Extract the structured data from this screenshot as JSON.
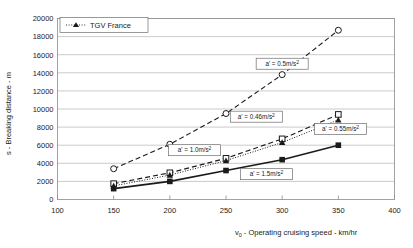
{
  "chart_data": {
    "type": "line",
    "title": "",
    "xlabel": "v0 - Operating cruising speed - km/hr",
    "ylabel": "s - Breaking distance - m",
    "xlim": [
      100,
      400
    ],
    "ylim": [
      0,
      20000
    ],
    "xticks": [
      100,
      150,
      200,
      250,
      300,
      350,
      400
    ],
    "yticks": [
      0,
      2000,
      4000,
      6000,
      8000,
      10000,
      12000,
      14000,
      16000,
      18000,
      20000
    ],
    "grid": true,
    "legend_position": "top-left",
    "series": [
      {
        "name": "a' = 0.5m/s2",
        "marker": "open-circle",
        "line": "dashed",
        "x": [
          150,
          200,
          250,
          300,
          350
        ],
        "values": [
          3400,
          6100,
          9500,
          13800,
          18700
        ]
      },
      {
        "name": "a' = 0.46m/s2 / a' = 0.55m/s2",
        "marker": "open-square",
        "line": "dashed",
        "x": [
          150,
          200,
          250,
          300,
          350
        ],
        "values": [
          1750,
          2950,
          4550,
          6700,
          9400
        ]
      },
      {
        "name": "TGV France",
        "marker": "filled-triangle",
        "line": "dotted",
        "x": [
          150,
          200,
          250,
          300,
          350
        ],
        "values": [
          1500,
          2700,
          4300,
          6300,
          8800
        ]
      },
      {
        "name": "a' = 1.5m/s2",
        "marker": "filled-square",
        "line": "solid",
        "x": [
          150,
          200,
          250,
          300,
          350
        ],
        "values": [
          1200,
          2000,
          3200,
          4400,
          6000
        ]
      }
    ],
    "annotations": [
      {
        "id": "ann-05",
        "text": "a' = 0.5m/s2",
        "base": "a' = 0.5m/s",
        "exp": "2",
        "x": 300,
        "y": 15000
      },
      {
        "id": "ann-046",
        "text": "a' = 0.46m/s2",
        "base": "a' = 0.46m/s",
        "exp": "2",
        "x": 277,
        "y": 9150
      },
      {
        "id": "ann-055",
        "text": "a' = 0.55m/s2",
        "base": "a' = 0.55m/s",
        "exp": "2",
        "x": 352,
        "y": 7800
      },
      {
        "id": "ann-10",
        "text": "a' = 1.0m/s2",
        "base": "a' = 1.0m/s",
        "exp": "2",
        "x": 222,
        "y": 5450
      },
      {
        "id": "ann-15",
        "text": "a' = 1.5m/s2",
        "base": "a' = 1.5m/s",
        "exp": "2",
        "x": 286,
        "y": 2800
      }
    ]
  },
  "legend": {
    "items": [
      {
        "label": "TGV France",
        "marker": "filled-triangle",
        "line": "dotted"
      }
    ]
  },
  "axes": {
    "x_title_base": "v",
    "x_title_sub": "0",
    "x_title_rest": " - Operating cruising speed - km/hr",
    "y_title": "s - Breaking distance - m",
    "x_tick_labels": [
      "100",
      "150",
      "200",
      "250",
      "300",
      "350",
      "400"
    ],
    "y_tick_labels": [
      "0",
      "2000",
      "4000",
      "6000",
      "8000",
      "10000",
      "12000",
      "14000",
      "16000",
      "18000",
      "20000"
    ]
  },
  "colors": {
    "grid": "#b4b4b4",
    "frame": "#8c8c8c",
    "ink": "#1a1a1a",
    "background": "#ffffff"
  }
}
